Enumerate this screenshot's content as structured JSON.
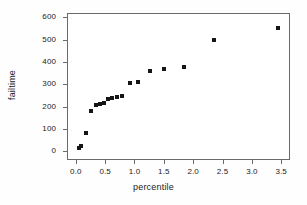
{
  "chart_data": {
    "type": "scatter",
    "title": "",
    "xlabel": "percentile",
    "ylabel": "failtime",
    "xlim": [
      -0.15,
      3.65
    ],
    "ylim": [
      -40,
      620
    ],
    "grid": false,
    "legend": null,
    "marker": "filled-square",
    "marker_color": "#151515",
    "xticks": [
      "0.0",
      "0.5",
      "1.0",
      "1.5",
      "2.0",
      "2.5",
      "3.0",
      "3.5"
    ],
    "xtick_values": [
      0.0,
      0.5,
      1.0,
      1.5,
      2.0,
      2.5,
      3.0,
      3.5
    ],
    "yticks": [
      "0",
      "100",
      "200",
      "300",
      "400",
      "500",
      "600"
    ],
    "ytick_values": [
      0,
      100,
      200,
      300,
      400,
      500,
      600
    ],
    "x": [
      0.05,
      0.09,
      0.18,
      0.26,
      0.34,
      0.42,
      0.48,
      0.55,
      0.62,
      0.7,
      0.79,
      0.92,
      1.06,
      1.27,
      1.51,
      1.85,
      2.36,
      3.44
    ],
    "y": [
      12,
      25,
      82,
      180,
      205,
      212,
      215,
      232,
      240,
      245,
      248,
      305,
      308,
      358,
      367,
      377,
      500,
      553
    ],
    "points": [
      {
        "x": 0.05,
        "y": 12
      },
      {
        "x": 0.09,
        "y": 25
      },
      {
        "x": 0.18,
        "y": 82
      },
      {
        "x": 0.26,
        "y": 180
      },
      {
        "x": 0.34,
        "y": 205
      },
      {
        "x": 0.42,
        "y": 212
      },
      {
        "x": 0.48,
        "y": 215
      },
      {
        "x": 0.55,
        "y": 232
      },
      {
        "x": 0.62,
        "y": 240
      },
      {
        "x": 0.7,
        "y": 245
      },
      {
        "x": 0.79,
        "y": 248
      },
      {
        "x": 0.92,
        "y": 305
      },
      {
        "x": 1.06,
        "y": 308
      },
      {
        "x": 1.27,
        "y": 358
      },
      {
        "x": 1.51,
        "y": 367
      },
      {
        "x": 1.85,
        "y": 377
      },
      {
        "x": 2.36,
        "y": 500
      },
      {
        "x": 3.44,
        "y": 553
      }
    ]
  },
  "axes": {
    "frame_color": "#6a6a6a",
    "background": "#ffffff"
  }
}
